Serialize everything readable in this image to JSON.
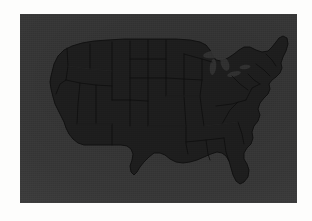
{
  "image": {
    "kind": "map-photograph",
    "subject": "Map of the contiguous United States",
    "panel": {
      "x": 20,
      "y": 14,
      "width": 277,
      "height": 189,
      "background_color": "#3a3a3a",
      "description": "Dark gray rectangular photographic panel with white page margin around it"
    },
    "page_background_color": "#fdfdfc",
    "land_color": "#1d1d1d",
    "border_color": "#0e0e0e",
    "lake_color": "#343434",
    "text_visible": "",
    "exposure_note": "Very dark, low-contrast exposure; state outlines are only faintly discernible"
  },
  "map": {
    "title": "",
    "region_label": "Contiguous United States",
    "features": {
      "landmass": "contiguous-us-silhouette",
      "state_borders": "visible-faint",
      "great_lakes": "visible",
      "florida_peninsula": "visible",
      "texas": "visible",
      "alaska": "not shown",
      "hawaii": "not shown"
    },
    "labels": []
  }
}
